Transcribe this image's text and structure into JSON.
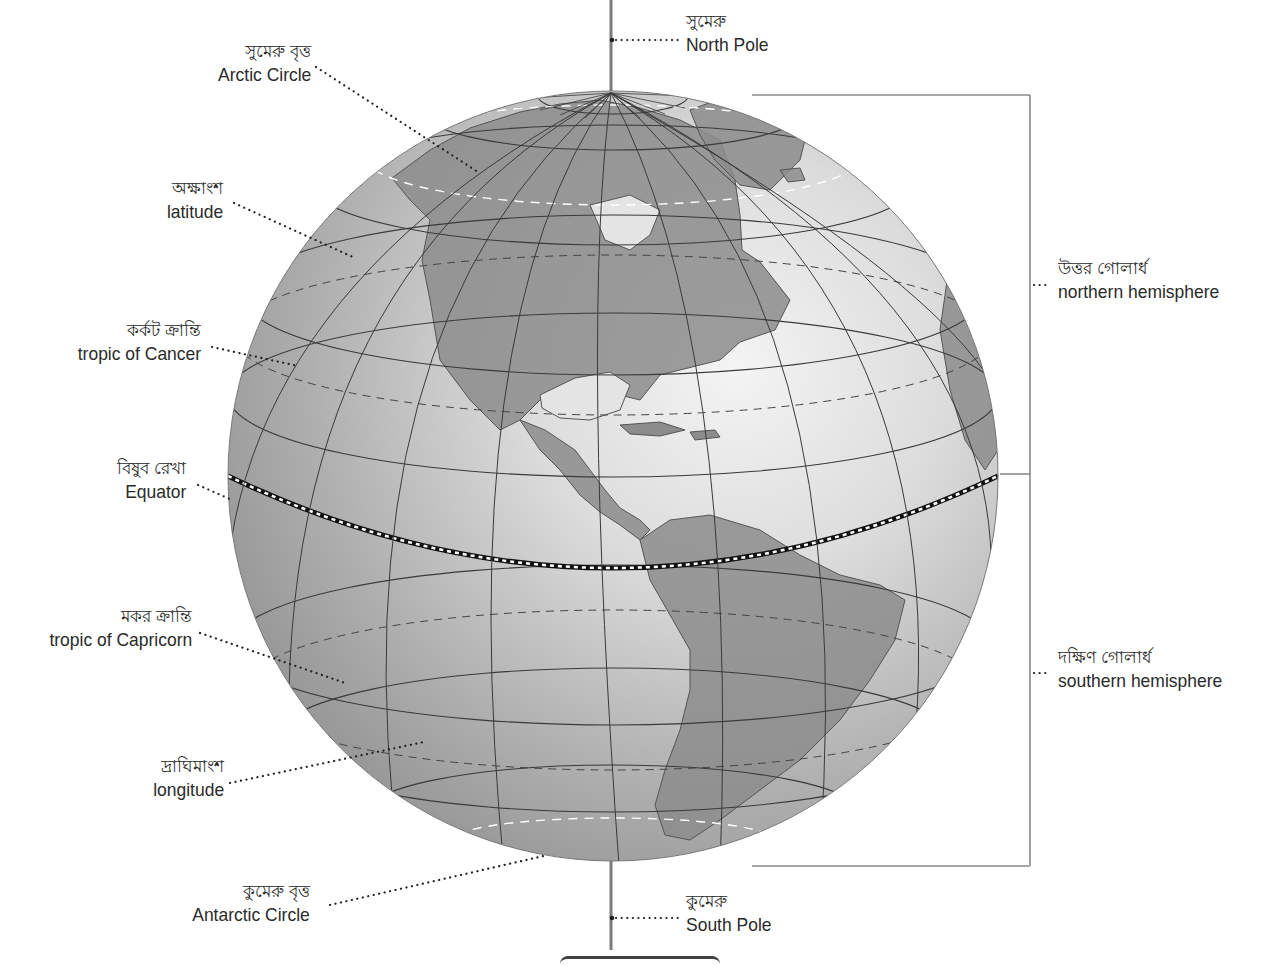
{
  "diagram": {
    "type": "labeled-globe",
    "colors": {
      "land": "#8a8a8a",
      "ocean_dark": "#9c9c9c",
      "ocean_light": "#e6e6e6",
      "grid_line": "#3a3a3a",
      "axis": "#7a7a7a",
      "leader_dots": "#222222",
      "bracket": "#8a8a8a",
      "text": "#2a2a2a"
    },
    "labels": {
      "north_pole": {
        "bn": "সুমেরু",
        "en": "North Pole"
      },
      "arctic_circle": {
        "bn": "সুমেরু বৃত্ত",
        "en": "Arctic Circle"
      },
      "latitude": {
        "bn": "অক্ষাংশ",
        "en": "latitude"
      },
      "tropic_cancer": {
        "bn": "কর্কট ক্রান্তি",
        "en": "tropic of Cancer"
      },
      "equator": {
        "bn": "বিষুব রেখা",
        "en": "Equator"
      },
      "tropic_capricorn": {
        "bn": "মকর ক্রান্তি",
        "en": "tropic of Capricorn"
      },
      "longitude": {
        "bn": "দ্রাঘিমাংশ",
        "en": "longitude"
      },
      "antarctic_circle": {
        "bn": "কুমেরু বৃত্ত",
        "en": "Antarctic Circle"
      },
      "south_pole": {
        "bn": "কুমেরু",
        "en": "South Pole"
      },
      "northern_hemisphere": {
        "bn": "উত্তর গোলার্ধ",
        "en": "northern hemisphere"
      },
      "southern_hemisphere": {
        "bn": "দক্ষিণ গোলার্ধ",
        "en": "southern hemisphere"
      }
    }
  }
}
